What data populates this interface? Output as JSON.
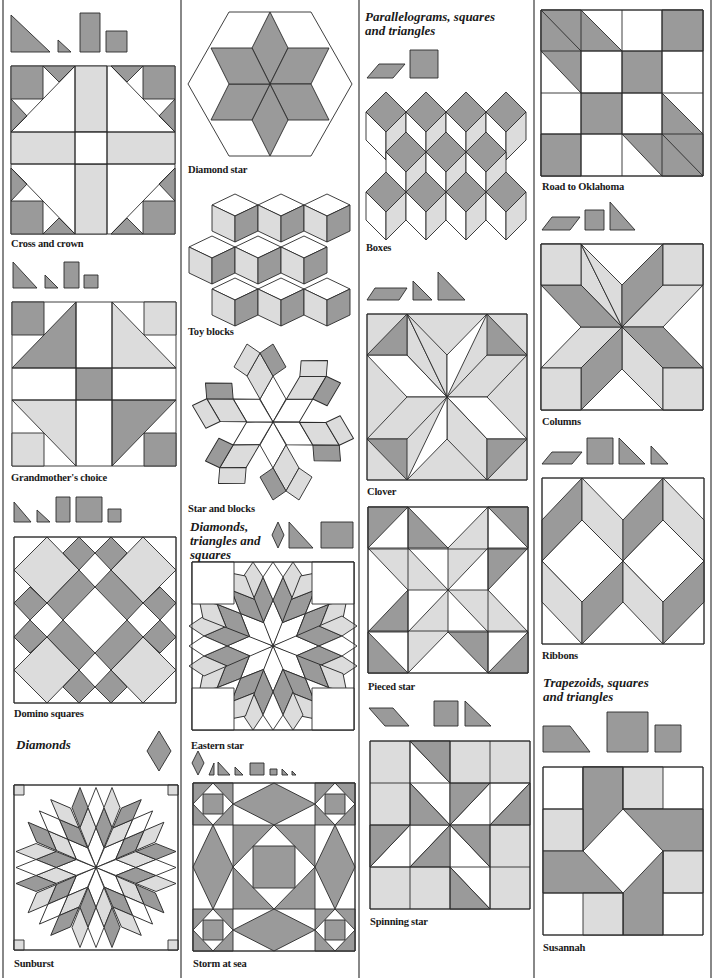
{
  "colors": {
    "dark": "#9a9a9a",
    "light": "#dcdcdc",
    "white": "#ffffff",
    "line": "#2a2a2a"
  },
  "headings": {
    "parallelograms": "Parallelograms, squares and triangles",
    "diamonds_triangles_squares": "Diamonds, triangles and squares",
    "diamonds": "Diamonds",
    "trapezoids": "Trapezoids, squares and triangles"
  },
  "blocks": {
    "cross_and_crown": "Cross and crown",
    "grandmothers_choice": "Grandmother's choice",
    "domino_squares": "Domino squares",
    "sunburst": "Sunburst",
    "diamond_star": "Diamond star",
    "toy_blocks": "Toy blocks",
    "star_and_blocks": "Star and blocks",
    "eastern_star": "Eastern star",
    "storm_at_sea": "Storm at sea",
    "boxes": "Boxes",
    "clover": "Clover",
    "pieced_star": "Pieced star",
    "spinning_star": "Spinning star",
    "road_to_oklahoma": "Road to Oklahoma",
    "columns": "Columns",
    "ribbons": "Ribbons",
    "susannah": "Susannah"
  },
  "headings_lines": {
    "parallelograms": [
      "Parallelograms, squares",
      "and triangles"
    ],
    "diamonds_triangles_squares": [
      "Diamonds,",
      "triangles and",
      "squares"
    ],
    "trapezoids": [
      "Trapezoids, squares",
      "and triangles"
    ]
  }
}
